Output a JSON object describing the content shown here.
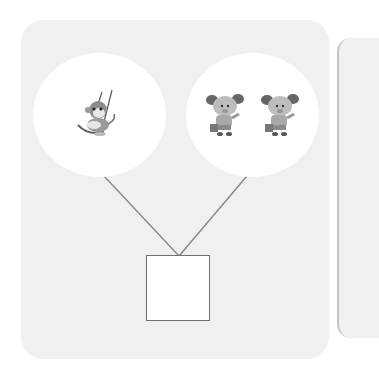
{
  "diagram": {
    "type": "number-bond",
    "groups": [
      {
        "id": "left",
        "items": [
          {
            "icon": "monkey-on-swing",
            "count": 1
          }
        ],
        "total": 1
      },
      {
        "id": "right",
        "items": [
          {
            "icon": "mouse-with-bucket",
            "count": 2
          }
        ],
        "total": 2
      }
    ],
    "answer_box": {
      "value": ""
    },
    "colors": {
      "panel": "#f0f0f0",
      "circle": "#ffffff",
      "line": "#8a8a8a",
      "box_border": "#6e6e6e"
    }
  }
}
